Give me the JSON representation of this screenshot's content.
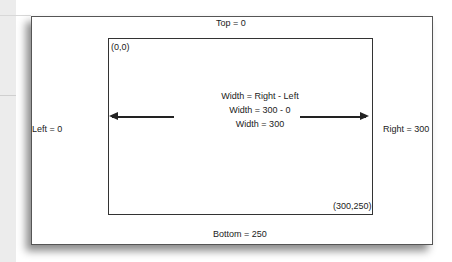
{
  "diagram": {
    "outer": {
      "top_label": "Top = 0",
      "left_label": "Left = 0",
      "right_label": "Right = 300",
      "bottom_label": "Bottom = 250"
    },
    "inner": {
      "origin_label": "(0,0)",
      "corner_label": "(300,250)",
      "formula": [
        "Width = Right - Left",
        "Width = 300 - 0",
        "Width = 300"
      ]
    },
    "arrows": {
      "left": "arrow-pointing-left",
      "right": "arrow-pointing-right"
    }
  }
}
